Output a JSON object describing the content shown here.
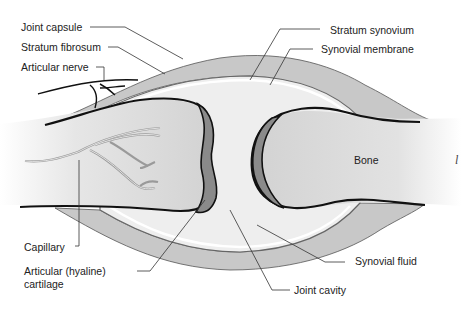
{
  "diagram": {
    "colors": {
      "capsule": "#c4c4c4",
      "cavity": "#ececec",
      "bone": "#d6d6d6",
      "cartilage": "#8a8a8a",
      "outline": "#111111",
      "leader": "#333333",
      "capillary": "#9a9a9a"
    },
    "labels": {
      "joint_capsule": "Joint capsule",
      "stratum_fibrosum": "Stratum fibrosum",
      "articular_nerve": "Articular nerve",
      "stratum_synovium": "Stratum synovium",
      "synovial_membrane": "Synovial membrane",
      "bone": "Bone",
      "capillary": "Capillary",
      "articular_cartilage_line1": "Articular (hyaline)",
      "articular_cartilage_line2": "cartilage",
      "synovial_fluid": "Synovial fluid",
      "joint_cavity": "Joint cavity",
      "edge_mark": "l"
    }
  }
}
